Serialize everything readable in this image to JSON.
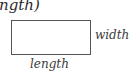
{
  "diagram": {
    "formula_fragment": "ngth)",
    "shape": "rectangle",
    "labels": {
      "width": "width",
      "length": "length"
    },
    "colors": {
      "stroke": "#555555",
      "text": "#333333",
      "background": "#ffffff"
    }
  }
}
